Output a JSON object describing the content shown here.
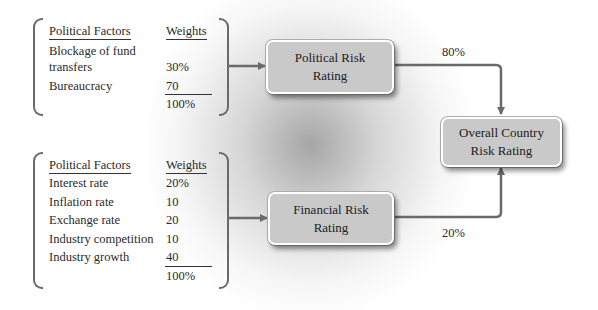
{
  "political_table": {
    "header_factor": "Political Factors",
    "header_weight": "Weights",
    "rows": [
      {
        "factor_line1": "Blockage of fund",
        "factor_line2": "transfers",
        "weight": "30%"
      },
      {
        "factor": "Bureaucracy",
        "weight": "70"
      }
    ],
    "total": "100%"
  },
  "financial_table": {
    "header_factor": "Political Factors",
    "header_weight": "Weights",
    "rows": [
      {
        "factor": "Interest rate",
        "weight": "20%"
      },
      {
        "factor": "Inflation rate",
        "weight": "10"
      },
      {
        "factor": "Exchange rate",
        "weight": "20"
      },
      {
        "factor": "Industry competition",
        "weight": "10"
      },
      {
        "factor": "Industry growth",
        "weight": "40"
      }
    ],
    "total": "100%"
  },
  "boxes": {
    "political": {
      "line1": "Political Risk",
      "line2": "Rating"
    },
    "financial": {
      "line1": "Financial Risk",
      "line2": "Rating"
    },
    "overall": {
      "line1": "Overall Country",
      "line2": "Risk Rating"
    }
  },
  "weights": {
    "political_share": "80%",
    "financial_share": "20%"
  },
  "colors": {
    "box_fill": "#c9c9c9",
    "connector": "#6a6a6a",
    "text": "#2a2a2a"
  }
}
